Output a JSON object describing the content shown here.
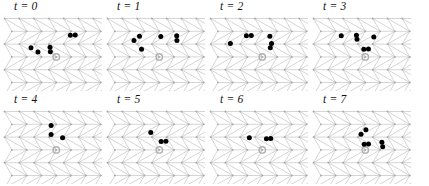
{
  "figure": {
    "width": 429,
    "height": 186,
    "background": "#ffffff",
    "rows": 2,
    "cols": 4
  },
  "style": {
    "lattice_line_color": "#b9b9b9",
    "lattice_node_color": "#a8a8a8",
    "particle_color": "#000000",
    "origin_marker_color": "#b0b0b0",
    "label_color": "#111111"
  },
  "lattice": {
    "type": "triangular",
    "spacing_x": 14.8,
    "spacing_y": 12.8,
    "cols": 8,
    "rows": 7,
    "origin_site": [
      3,
      3
    ],
    "node_radius": 0.9,
    "particle_radius": 2.5,
    "origin_radius": 3.2
  },
  "panels": [
    {
      "id": "panel-t0",
      "label": "t = 0",
      "x": 0,
      "y": 0,
      "particles": [
        {
          "col": 1.65,
          "row": 2.28
        },
        {
          "col": 1.95,
          "row": 2.62
        },
        {
          "col": 2.95,
          "row": 2.25
        },
        {
          "col": 2.8,
          "row": 2.6
        },
        {
          "col": 4.1,
          "row": 1.3
        },
        {
          "col": 4.42,
          "row": 1.28
        }
      ]
    },
    {
      "id": "panel-t1",
      "label": "t = 1",
      "x": 103,
      "y": 0,
      "particles": [
        {
          "col": 1.85,
          "row": 1.38
        },
        {
          "col": 1.65,
          "row": 1.72
        },
        {
          "col": 2.1,
          "row": 2.4
        },
        {
          "col": 3.3,
          "row": 1.4
        },
        {
          "col": 4.35,
          "row": 1.35
        },
        {
          "col": 4.55,
          "row": 1.72
        }
      ]
    },
    {
      "id": "panel-t2",
      "label": "t = 2",
      "x": 206,
      "y": 0,
      "particles": [
        {
          "col": 2.1,
          "row": 1.35
        },
        {
          "col": 2.42,
          "row": 1.33
        },
        {
          "col": 1.32,
          "row": 1.95
        },
        {
          "col": 3.7,
          "row": 1.38
        },
        {
          "col": 4.1,
          "row": 1.95
        },
        {
          "col": 3.9,
          "row": 2.28
        }
      ]
    },
    {
      "id": "panel-t3",
      "label": "t = 3",
      "x": 309,
      "y": 0,
      "particles": [
        {
          "col": 1.55,
          "row": 1.35
        },
        {
          "col": 2.55,
          "row": 1.3
        },
        {
          "col": 2.75,
          "row": 1.62
        },
        {
          "col": 3.8,
          "row": 1.45
        },
        {
          "col": 3.2,
          "row": 2.4
        },
        {
          "col": 3.52,
          "row": 2.38
        }
      ]
    },
    {
      "id": "panel-t4",
      "label": "t = 4",
      "x": 0,
      "y": 93,
      "particles": [
        {
          "col": 2.7,
          "row": 1.1
        },
        {
          "col": 3.05,
          "row": 1.8
        },
        {
          "col": 3.9,
          "row": 2.05
        }
      ]
    },
    {
      "id": "panel-t5",
      "label": "t = 5",
      "x": 103,
      "y": 93,
      "particles": [
        {
          "col": 2.75,
          "row": 1.65
        },
        {
          "col": 3.45,
          "row": 2.35
        },
        {
          "col": 3.78,
          "row": 2.33
        }
      ]
    },
    {
      "id": "panel-t6",
      "label": "t = 6",
      "x": 206,
      "y": 93,
      "particles": [
        {
          "col": 2.6,
          "row": 2.05
        },
        {
          "col": 3.72,
          "row": 2.12
        },
        {
          "col": 4.02,
          "row": 2.1
        }
      ]
    },
    {
      "id": "panel-t7",
      "label": "t = 7",
      "x": 309,
      "y": 93,
      "particles": [
        {
          "col": 3.25,
          "row": 1.42
        },
        {
          "col": 3.1,
          "row": 1.78
        },
        {
          "col": 3.15,
          "row": 2.55
        },
        {
          "col": 3.45,
          "row": 2.53
        },
        {
          "col": 4.42,
          "row": 2.4
        },
        {
          "col": 4.3,
          "row": 2.75
        }
      ]
    }
  ]
}
